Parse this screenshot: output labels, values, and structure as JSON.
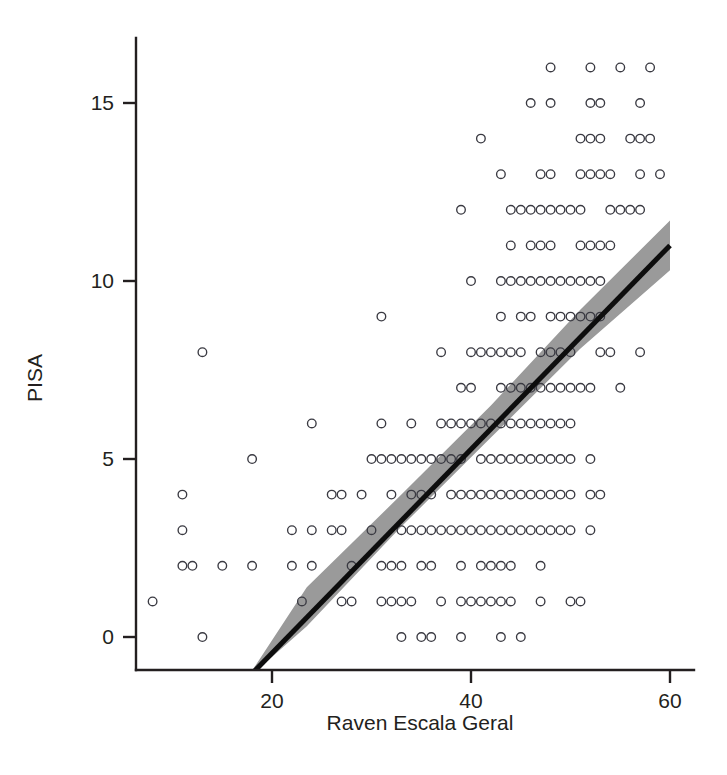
{
  "chart_data": {
    "type": "scatter",
    "title": "",
    "subtitle": "",
    "xlabel": "Raven Escala Geral",
    "ylabel": "PISA",
    "xlim": [
      7,
      62
    ],
    "ylim": [
      -1.2,
      16.8
    ],
    "xticks": [
      20,
      40,
      60
    ],
    "xtick_labels": [
      "20",
      "40",
      "60"
    ],
    "yticks": [
      0,
      5,
      10,
      15
    ],
    "ytick_labels": [
      "0",
      "5",
      "10",
      "15"
    ],
    "grid": false,
    "legend": null,
    "marker": "open-circle",
    "marker_color": "#3a3a42",
    "fit_line_color": "#0d0d0d",
    "ci_band_color": "#9a9a9a",
    "fit_line": {
      "description": "linear regression line with 95% confidence band",
      "x_start": 17.4,
      "y_start": -1.2,
      "x_end": 60.0,
      "y_end": 11.0,
      "slope": 0.2864,
      "intercept": -6.183
    },
    "ci_band_points": [
      {
        "x": 13.6,
        "y_lower": -1.2,
        "y_upper": -1.2
      },
      {
        "x": 17.4,
        "y_lower": -1.2,
        "y_upper": -1.2
      },
      {
        "x": 23.5,
        "y_lower": 0.3,
        "y_upper": 1.4
      },
      {
        "x": 33.0,
        "y_lower": 3.1,
        "y_upper": 4.0
      },
      {
        "x": 42.0,
        "y_lower": 5.6,
        "y_upper": 6.5
      },
      {
        "x": 51.0,
        "y_lower": 8.1,
        "y_upper": 9.2
      },
      {
        "x": 60.0,
        "y_lower": 10.3,
        "y_upper": 11.7
      }
    ],
    "series": [
      {
        "name": "students",
        "points_by_pisa": [
          {
            "pisa": 16,
            "raven": [
              48,
              52,
              55,
              58
            ]
          },
          {
            "pisa": 15,
            "raven": [
              46,
              48,
              52,
              53,
              57
            ]
          },
          {
            "pisa": 14,
            "raven": [
              41,
              51,
              52,
              53,
              56,
              57,
              58
            ]
          },
          {
            "pisa": 13,
            "raven": [
              43,
              47,
              48,
              51,
              52,
              53,
              54,
              57,
              59
            ]
          },
          {
            "pisa": 12,
            "raven": [
              39,
              44,
              45,
              46,
              47,
              48,
              49,
              50,
              51,
              54,
              55,
              56,
              57
            ]
          },
          {
            "pisa": 11,
            "raven": [
              44,
              46,
              47,
              48,
              51,
              52,
              53,
              54
            ]
          },
          {
            "pisa": 10,
            "raven": [
              40,
              43,
              44,
              45,
              46,
              47,
              48,
              49,
              50,
              51,
              52,
              53
            ]
          },
          {
            "pisa": 9,
            "raven": [
              31,
              43,
              45,
              46,
              48,
              49,
              50,
              51,
              52,
              53
            ]
          },
          {
            "pisa": 8,
            "raven": [
              13,
              37,
              40,
              41,
              42,
              43,
              44,
              45,
              47,
              48,
              49,
              50,
              53,
              54,
              57
            ]
          },
          {
            "pisa": 7,
            "raven": [
              39,
              40,
              43,
              44,
              45,
              46,
              47,
              48,
              49,
              50,
              51,
              52,
              55
            ]
          },
          {
            "pisa": 6,
            "raven": [
              24,
              31,
              34,
              37,
              38,
              39,
              40,
              41,
              42,
              43,
              44,
              45,
              46,
              47,
              48,
              49,
              50
            ]
          },
          {
            "pisa": 5,
            "raven": [
              18,
              30,
              31,
              32,
              33,
              34,
              35,
              36,
              37,
              38,
              39,
              41,
              42,
              43,
              44,
              45,
              46,
              47,
              48,
              49,
              50,
              52
            ]
          },
          {
            "pisa": 4,
            "raven": [
              11,
              26,
              27,
              29,
              32,
              34,
              35,
              36,
              38,
              39,
              40,
              41,
              42,
              43,
              44,
              45,
              46,
              47,
              48,
              49,
              50,
              52,
              53
            ]
          },
          {
            "pisa": 3,
            "raven": [
              11,
              22,
              24,
              26,
              27,
              30,
              33,
              34,
              35,
              36,
              37,
              38,
              39,
              40,
              41,
              42,
              43,
              44,
              45,
              46,
              47,
              48,
              49,
              50,
              52
            ]
          },
          {
            "pisa": 2,
            "raven": [
              11,
              12,
              15,
              18,
              22,
              24,
              28,
              31,
              32,
              33,
              35,
              36,
              39,
              41,
              42,
              43,
              44,
              47
            ]
          },
          {
            "pisa": 1,
            "raven": [
              8,
              23,
              27,
              28,
              31,
              32,
              33,
              34,
              37,
              39,
              40,
              41,
              42,
              43,
              44,
              47,
              50,
              51
            ]
          },
          {
            "pisa": 0,
            "raven": [
              13,
              33,
              35,
              36,
              39,
              43,
              45
            ]
          }
        ]
      }
    ]
  }
}
